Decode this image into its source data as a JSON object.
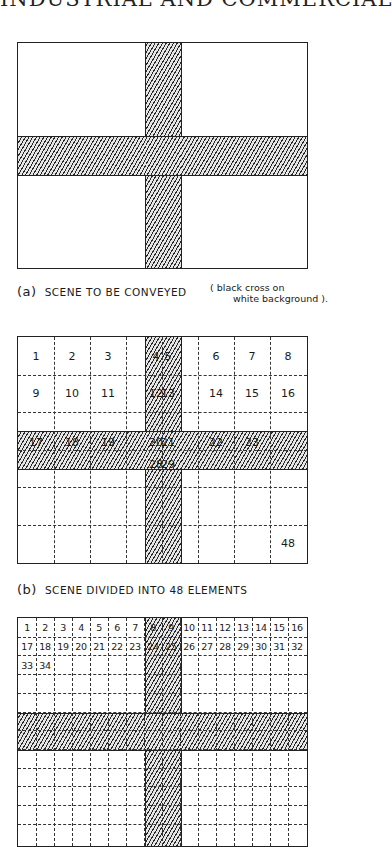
{
  "header": {
    "title": "INDUSTRIAL AND COMMERCIAL"
  },
  "figure_a": {
    "caption_tag": "(a)",
    "caption_text": "SCENE TO BE CONVEYED",
    "note_line1": "( black cross on",
    "note_line2": "white background )."
  },
  "figure_b": {
    "caption_tag": "(b)",
    "caption_text": "SCENE DIVIDED INTO 48 ELEMENTS",
    "columns": 8,
    "rows": 6,
    "labels": [
      {
        "text": "1",
        "col": 0,
        "row": 0
      },
      {
        "text": "2",
        "col": 1,
        "row": 0
      },
      {
        "text": "3",
        "col": 2,
        "row": 0
      },
      {
        "text": "4",
        "col": 3,
        "row": 0
      },
      {
        "text": "5",
        "col": 4,
        "row": 0
      },
      {
        "text": "6",
        "col": 5,
        "row": 0
      },
      {
        "text": "7",
        "col": 6,
        "row": 0
      },
      {
        "text": "8",
        "col": 7,
        "row": 0
      },
      {
        "text": "9",
        "col": 0,
        "row": 1
      },
      {
        "text": "10",
        "col": 1,
        "row": 1
      },
      {
        "text": "11",
        "col": 2,
        "row": 1
      },
      {
        "text": "12",
        "col": 3,
        "row": 1
      },
      {
        "text": "13",
        "col": 4,
        "row": 1
      },
      {
        "text": "14",
        "col": 5,
        "row": 1
      },
      {
        "text": "15",
        "col": 6,
        "row": 1
      },
      {
        "text": "16",
        "col": 7,
        "row": 1
      },
      {
        "text": "17",
        "col": 0,
        "row": 2
      },
      {
        "text": "18",
        "col": 1,
        "row": 2
      },
      {
        "text": "19",
        "col": 2,
        "row": 2
      },
      {
        "text": "20",
        "col": 3,
        "row": 2
      },
      {
        "text": "21",
        "col": 4,
        "row": 2
      },
      {
        "text": "22",
        "col": 5,
        "row": 2
      },
      {
        "text": "23",
        "col": 6,
        "row": 2
      },
      {
        "text": "28",
        "col": 3,
        "row": 3
      },
      {
        "text": "29",
        "col": 4,
        "row": 3
      },
      {
        "text": "48",
        "col": 7,
        "row": 5
      }
    ]
  },
  "figure_c": {
    "columns": 16,
    "row1": [
      "1",
      "2",
      "3",
      "4",
      "5",
      "6",
      "7",
      "8",
      "9",
      "10",
      "11",
      "12",
      "13",
      "14",
      "15",
      "16"
    ],
    "row2": [
      "17",
      "18",
      "19",
      "20",
      "21",
      "22",
      "23",
      "24",
      "25",
      "26",
      "27",
      "28",
      "29",
      "30",
      "31",
      "32"
    ],
    "row3": [
      "33",
      "34"
    ]
  }
}
